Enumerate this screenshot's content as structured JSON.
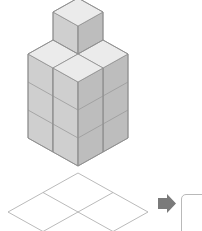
{
  "page": {
    "background_color": "#ffffff"
  },
  "solid": {
    "name": "cube-stack-figure",
    "description": "Isometric stack of unit cubes",
    "cube_count": 14,
    "footprint": "2x2",
    "levels": 4,
    "colors": {
      "top_face": "#ebebeb",
      "left_face": "#cfcfcf",
      "right_face": "#bdbdbd",
      "edge": "#8f8f8f"
    },
    "geometry": {
      "origin_x": 78,
      "origin_y": 166,
      "half_width": 25,
      "half_depth": 14,
      "cube_height": 28
    },
    "columns": [
      {
        "name": "back",
        "grid": [
          0,
          0
        ],
        "height": 4
      },
      {
        "name": "left",
        "grid": [
          -1,
          0
        ],
        "height": 3
      },
      {
        "name": "right",
        "grid": [
          0,
          1
        ],
        "height": 3
      },
      {
        "name": "front",
        "grid": [
          -1,
          1
        ],
        "height": 3
      }
    ]
  },
  "base_grid": {
    "name": "base-plan-grid",
    "rows": 2,
    "cols": 2,
    "color": "#a8a8a8",
    "center_x": 78,
    "center_y": 212,
    "half_width": 70,
    "half_depth": 39
  },
  "arrow": {
    "name": "right-arrow",
    "color": "#7a7a7a",
    "direction": "right",
    "x": 158,
    "y": 203
  },
  "answer_box": {
    "name": "answer-drop-area",
    "border_color": "#b9b9b9",
    "fill": "#ffffff"
  }
}
